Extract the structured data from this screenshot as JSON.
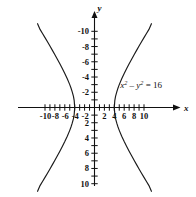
{
  "figure": {
    "background_color": "#ffffff",
    "curve_color": "#1a1a1a",
    "axis_color": "#111111"
  },
  "axes": {
    "x_name": "x",
    "y_name": "y",
    "x_labels": [
      "-10",
      "-8",
      "-6",
      "-4",
      "-2",
      "2",
      "4",
      "6",
      "8",
      "10"
    ],
    "y_labels": [
      "10",
      "8",
      "6",
      "4",
      "2",
      "-2",
      "-4",
      "-6",
      "-8",
      "-10"
    ]
  },
  "equation": {
    "lhs_var1": "x",
    "lhs_exp1": "2",
    "minus": "–",
    "lhs_var2": "y",
    "lhs_exp2": "2",
    "equals": "=",
    "rhs": "16",
    "plain": "x2 – y2 = 16"
  },
  "chart_data": {
    "type": "line",
    "xlabel": "x",
    "ylabel": "y",
    "xlim": [
      -11.5,
      11.5
    ],
    "ylim": [
      -11.5,
      11.5
    ],
    "grid": false,
    "legend": "none",
    "annotations": [
      {
        "text": "x² − y² = 16",
        "x": 5.2,
        "y": 2.6
      }
    ],
    "xticks": [
      -10,
      -9,
      -8,
      -7,
      -6,
      -5,
      -4,
      -3,
      -2,
      -1,
      1,
      2,
      3,
      4,
      5,
      6,
      7,
      8,
      9,
      10
    ],
    "xtick_labels": [
      -10,
      -8,
      -6,
      -4,
      -2,
      2,
      4,
      6,
      8,
      10
    ],
    "yticks": [
      -10,
      -9,
      -8,
      -7,
      -6,
      -5,
      -4,
      -3,
      -2,
      -1,
      1,
      2,
      3,
      4,
      5,
      6,
      7,
      8,
      9,
      10
    ],
    "ytick_labels": [
      -10,
      -8,
      -6,
      -4,
      -2,
      2,
      4,
      6,
      8,
      10
    ],
    "vertices": [
      [
        -4,
        0
      ],
      [
        4,
        0
      ]
    ],
    "series": [
      {
        "name": "right branch",
        "points": [
          [
            11.5,
            11.0
          ],
          [
            11.0,
            10.25
          ],
          [
            10.5,
            9.72
          ],
          [
            10.0,
            9.17
          ],
          [
            9.5,
            8.62
          ],
          [
            9.0,
            8.06
          ],
          [
            8.5,
            7.5
          ],
          [
            8.0,
            6.93
          ],
          [
            7.5,
            6.34
          ],
          [
            7.0,
            5.74
          ],
          [
            6.5,
            5.12
          ],
          [
            6.0,
            4.47
          ],
          [
            5.5,
            3.77
          ],
          [
            5.0,
            3.0
          ],
          [
            4.75,
            2.56
          ],
          [
            4.5,
            2.06
          ],
          [
            4.25,
            1.45
          ],
          [
            4.1,
            0.9
          ],
          [
            4.0,
            0.0
          ],
          [
            4.1,
            -0.9
          ],
          [
            4.25,
            -1.45
          ],
          [
            4.5,
            -2.06
          ],
          [
            4.75,
            -2.56
          ],
          [
            5.0,
            -3.0
          ],
          [
            5.5,
            -3.77
          ],
          [
            6.0,
            -4.47
          ],
          [
            6.5,
            -5.12
          ],
          [
            7.0,
            -5.74
          ],
          [
            7.5,
            -6.34
          ],
          [
            8.0,
            -6.93
          ],
          [
            8.5,
            -7.5
          ],
          [
            9.0,
            -8.06
          ],
          [
            9.5,
            -8.62
          ],
          [
            10.0,
            -9.17
          ],
          [
            10.5,
            -9.72
          ],
          [
            11.0,
            -10.25
          ],
          [
            11.5,
            -11.0
          ]
        ]
      },
      {
        "name": "left branch",
        "points": [
          [
            -11.5,
            11.0
          ],
          [
            -11.0,
            10.25
          ],
          [
            -10.5,
            9.72
          ],
          [
            -10.0,
            9.17
          ],
          [
            -9.5,
            8.62
          ],
          [
            -9.0,
            8.06
          ],
          [
            -8.5,
            7.5
          ],
          [
            -8.0,
            6.93
          ],
          [
            -7.5,
            6.34
          ],
          [
            -7.0,
            5.74
          ],
          [
            -6.5,
            5.12
          ],
          [
            -6.0,
            4.47
          ],
          [
            -5.5,
            3.77
          ],
          [
            -5.0,
            3.0
          ],
          [
            -4.75,
            2.56
          ],
          [
            -4.5,
            2.06
          ],
          [
            -4.25,
            1.45
          ],
          [
            -4.1,
            0.9
          ],
          [
            -4.0,
            0.0
          ],
          [
            -4.1,
            -0.9
          ],
          [
            -4.25,
            -1.45
          ],
          [
            -4.5,
            -2.06
          ],
          [
            -4.75,
            -2.56
          ],
          [
            -5.0,
            -3.0
          ],
          [
            -5.5,
            -3.77
          ],
          [
            -6.0,
            -4.47
          ],
          [
            -6.5,
            -5.12
          ],
          [
            -7.0,
            -5.74
          ],
          [
            -7.5,
            -6.34
          ],
          [
            -8.0,
            -6.93
          ],
          [
            -8.5,
            -7.5
          ],
          [
            -9.0,
            -8.06
          ],
          [
            -9.5,
            -8.62
          ],
          [
            -10.0,
            -9.17
          ],
          [
            -10.5,
            -9.72
          ],
          [
            -11.0,
            -10.25
          ],
          [
            -11.5,
            -11.0
          ]
        ]
      }
    ]
  }
}
